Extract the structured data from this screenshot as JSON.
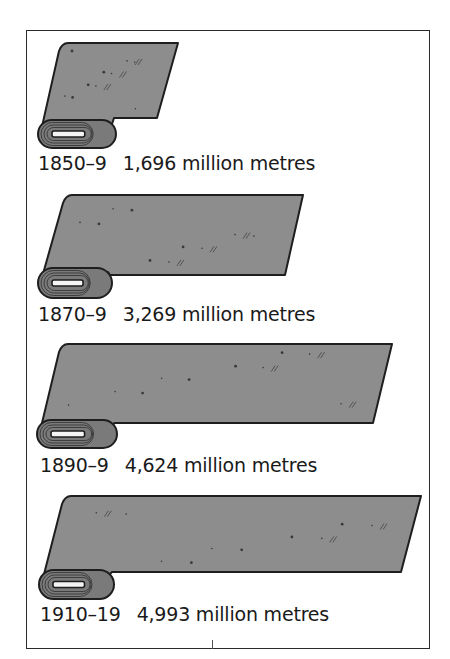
{
  "chart_data": {
    "type": "bar",
    "orientation": "horizontal",
    "style": "pictogram (rolls of cloth)",
    "title": "",
    "xlabel": "",
    "ylabel": "",
    "unit": "million metres",
    "categories": [
      "1850–9",
      "1870–9",
      "1890–9",
      "1910–19"
    ],
    "values": [
      1696,
      3269,
      4624,
      4993
    ],
    "labels": [
      "1,696 million metres",
      "3,269 million metres",
      "4,624 million metres",
      "4,993 million metres"
    ],
    "legend": [],
    "grid": false
  },
  "colors": {
    "fabric": "#8d8d8d",
    "outline": "#1e1e1e",
    "roll": "#7a7a7a",
    "frame": "#2a2a2a",
    "background": "#ffffff"
  },
  "rows": [
    {
      "period": "1850–9",
      "value_text": "1,696 million metres",
      "sheet": {
        "tlx": 62,
        "tly": 43,
        "trx": 178,
        "bry": 118,
        "brx": 157
      },
      "roll": {
        "x": 38,
        "y": 120,
        "w": 78,
        "h": 28
      },
      "label_y": 152
    },
    {
      "period": "1870–9",
      "value_text": "3,269 million metres",
      "sheet": {
        "tlx": 66,
        "tly": 195,
        "trx": 303,
        "bry": 275,
        "brx": 285
      },
      "roll": {
        "x": 38,
        "y": 268,
        "w": 74,
        "h": 30
      },
      "label_y": 303
    },
    {
      "period": "1890–9",
      "value_text": "4,624 million metres",
      "sheet": {
        "tlx": 62,
        "tly": 344,
        "trx": 392,
        "bry": 423,
        "brx": 373
      },
      "roll": {
        "x": 37,
        "y": 420,
        "w": 80,
        "h": 28
      },
      "label_y": 454
    },
    {
      "period": "1910–19",
      "value_text": "4,993 million metres",
      "sheet": {
        "tlx": 65,
        "tly": 496,
        "trx": 421,
        "bry": 572,
        "brx": 401
      },
      "roll": {
        "x": 39,
        "y": 570,
        "w": 75,
        "h": 29
      },
      "label_y": 603
    }
  ]
}
